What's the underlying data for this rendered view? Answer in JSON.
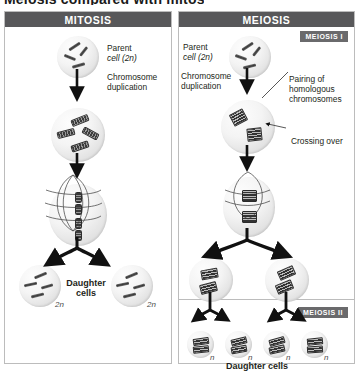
{
  "figure": {
    "cut_title": "Meiosis compared with mitosis"
  },
  "mitosis": {
    "header": "MITOSIS",
    "parent_label_line1": "Parent",
    "parent_label_line2": "cell (2n)",
    "duplication_line1": "Chromosome",
    "duplication_line2": "duplication",
    "daughter_line1": "Daughter",
    "daughter_line2": "cells",
    "ploidy_left": "2n",
    "ploidy_right": "2n"
  },
  "meiosis": {
    "header": "MEIOSIS",
    "badge_one": "MEIOSIS I",
    "badge_two": "MEIOSIS II",
    "parent_label_line1": "Parent",
    "parent_label_line2": "cell (2n)",
    "duplication_line1": "Chromosome",
    "duplication_line2": "duplication",
    "pairing_line1": "Pairing of",
    "pairing_line2": "homologous",
    "pairing_line3": "chromosomes",
    "crossing_over": "Crossing over",
    "daughter_cells": "Daughter cells",
    "ploidy_intermediate_left": "",
    "haploid_labels": [
      "n",
      "n",
      "n",
      "n"
    ]
  },
  "colors": {
    "header_bar": "#58585a",
    "badge": "#6a6a6c",
    "panel_border": "#bcbcbc",
    "chromosome": "#4a4a4a",
    "text": "#231f20"
  }
}
